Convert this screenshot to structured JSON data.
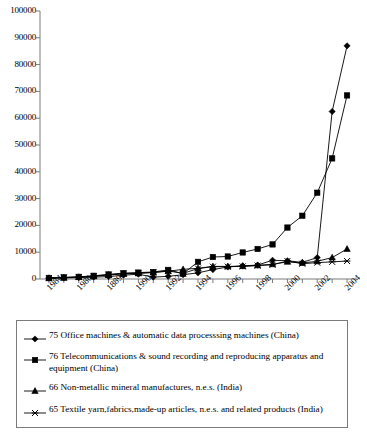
{
  "chart_data": {
    "type": "line",
    "title": "",
    "xlabel": "",
    "ylabel": "",
    "ylim": [
      0,
      100000
    ],
    "ytick_step": 10000,
    "grid": false,
    "legend_position": "below-plot",
    "ytick_labels": [
      "0",
      "10000",
      "20000",
      "30000",
      "40000",
      "50000",
      "60000",
      "70000",
      "80000",
      "90000",
      "100000"
    ],
    "x": [
      1984,
      1985,
      1986,
      1987,
      1988,
      1989,
      1990,
      1991,
      1992,
      1993,
      1994,
      1995,
      1996,
      1997,
      1998,
      1999,
      2000,
      2001,
      2002,
      2003,
      2004
    ],
    "xtick_labels_shown": [
      "1984",
      "1986",
      "1889",
      "1990",
      "1992",
      "1994",
      "1996",
      "1998",
      "2000",
      "2002",
      "2004"
    ],
    "xtick_label_years": [
      1984,
      1986,
      1988,
      1990,
      1992,
      1994,
      1996,
      1998,
      2000,
      2002,
      2004
    ],
    "series": [
      {
        "name": "75 Office machines & automatic data processsing machines (China)",
        "marker": "diamond",
        "values": [
          300,
          400,
          500,
          700,
          900,
          1400,
          1800,
          700,
          1000,
          1600,
          2300,
          3500,
          4500,
          4900,
          5200,
          7000,
          6800,
          6200,
          8000,
          62500,
          87000
        ]
      },
      {
        "name": "76 Telecommunications & sound recording and reproducing apparatus and equipment (China)",
        "marker": "square",
        "values": [
          400,
          600,
          800,
          1200,
          1700,
          2200,
          2400,
          2600,
          3400,
          2000,
          6400,
          8200,
          8400,
          9900,
          11200,
          12900,
          19200,
          23600,
          32200,
          45000,
          68500
        ]
      },
      {
        "name": "66 Non-metallic mineral manufactures, n.e.s. (India)",
        "marker": "triangle",
        "values": [
          300,
          500,
          700,
          1000,
          1500,
          1900,
          2100,
          2400,
          2900,
          3600,
          4000,
          4700,
          4700,
          4800,
          5100,
          5500,
          6400,
          6000,
          6600,
          8000,
          11200
        ]
      },
      {
        "name": "65 Textile yarn,fabrics,made-up articles, n.e.s. and related products (India)",
        "marker": "x-star",
        "values": [
          350,
          550,
          750,
          1100,
          1600,
          2000,
          2200,
          2500,
          3000,
          2100,
          3900,
          4600,
          4600,
          4700,
          5000,
          5300,
          6700,
          5700,
          6100,
          6400,
          6700
        ]
      }
    ]
  },
  "legend": {
    "entries": [
      {
        "marker": "diamond",
        "label": "75 Office machines & automatic data processsing machines (China)"
      },
      {
        "marker": "square",
        "label": "76 Telecommunications & sound recording and reproducing apparatus and equipment (China)"
      },
      {
        "marker": "triangle",
        "label": "66 Non-metallic mineral manufactures, n.e.s. (India)"
      },
      {
        "marker": "x-star",
        "label": "65 Textile yarn,fabrics,made-up articles, n.e.s. and related products (India)"
      }
    ]
  },
  "colors": {
    "series": "#000000",
    "axis": "#7b7b7b",
    "legend_border": "#7b7b7b",
    "background": "#ffffff"
  }
}
